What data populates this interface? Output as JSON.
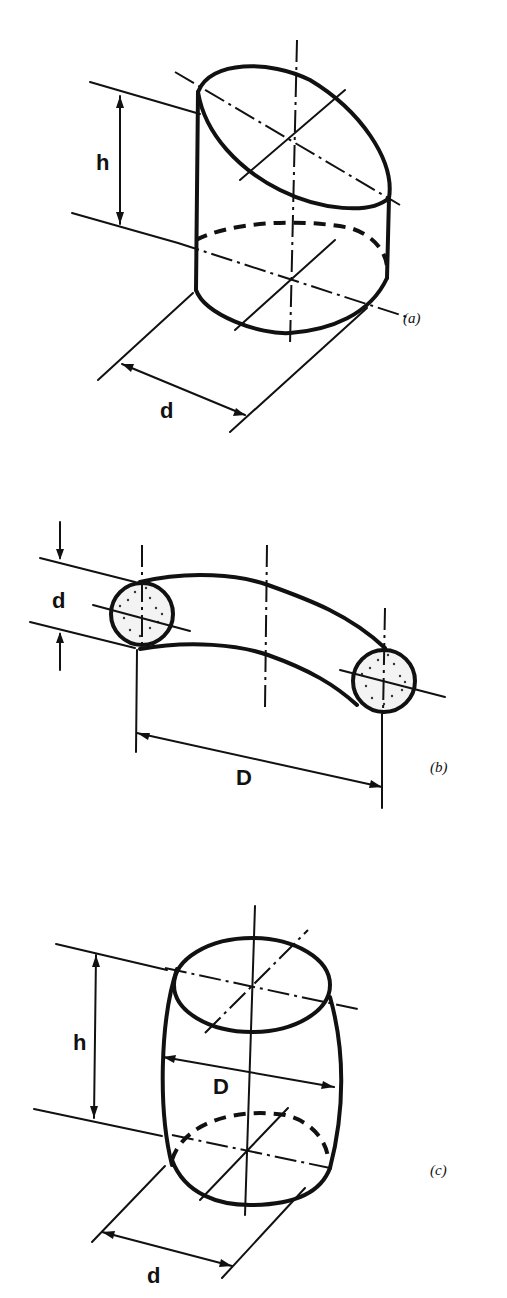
{
  "figure": {
    "panels": [
      {
        "id": "a",
        "caption": "(a)",
        "shape": "obliquely truncated cylinder",
        "labels": {
          "height": "h",
          "diameter": "d"
        }
      },
      {
        "id": "b",
        "caption": "(b)",
        "shape": "torus segment (curved rod with circular cross-section)",
        "labels": {
          "section_diameter": "d",
          "ring_diameter": "D"
        }
      },
      {
        "id": "c",
        "caption": "(c)",
        "shape": "barrel",
        "labels": {
          "height": "h",
          "bulge_diameter": "D",
          "end_diameter": "d"
        }
      }
    ]
  },
  "colors": {
    "ink": "#111111",
    "background": "#ffffff"
  }
}
